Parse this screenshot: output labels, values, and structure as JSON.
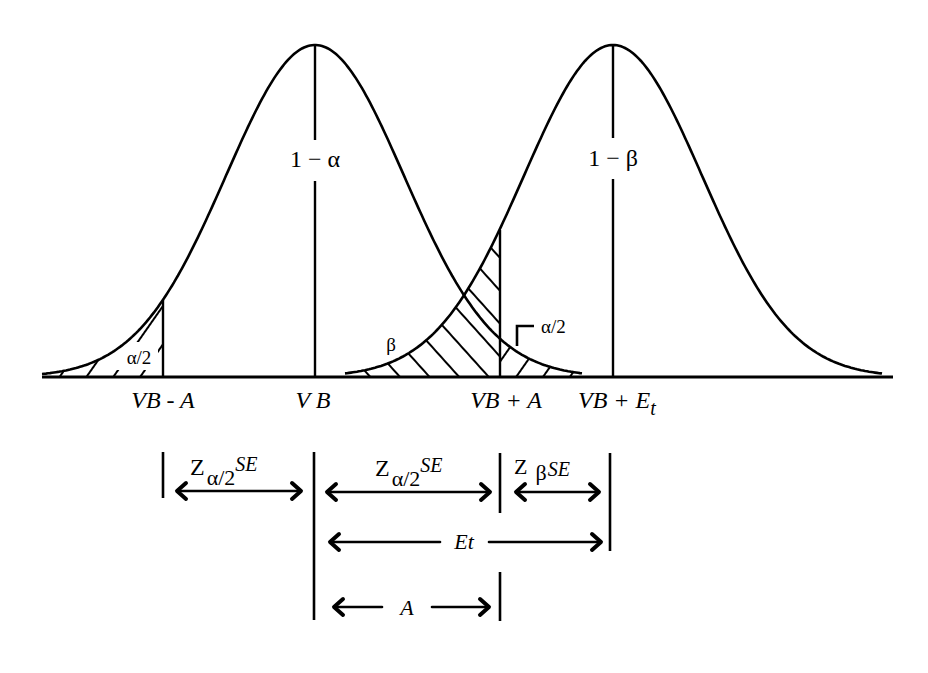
{
  "diagram": {
    "type": "two overlapping normal distributions (hypothesis test power diagram)",
    "colors": {
      "ink": "#000000",
      "background": "#ffffff"
    },
    "baseline": {
      "y": 377,
      "x_start": 42,
      "x_end": 893
    },
    "curves": [
      {
        "name": "null-distribution",
        "mean_x": 315,
        "sigma": 89,
        "peak_y": 45,
        "x_start": 42,
        "x_end": 582,
        "center_label": "1 − α"
      },
      {
        "name": "alternative-distribution",
        "mean_x": 613,
        "sigma": 89,
        "peak_y": 45,
        "x_start": 345,
        "x_end": 882,
        "center_label": "1 − β"
      }
    ],
    "markers": [
      {
        "name": "vb-minus-a",
        "x": 163,
        "label": "VB - A"
      },
      {
        "name": "vb",
        "x": 315,
        "label": "V B"
      },
      {
        "name": "vb-plus-a",
        "x": 500,
        "label": "VB + A"
      },
      {
        "name": "vb-plus-et",
        "x": 613,
        "label_main": "VB + E",
        "label_sub": "t"
      }
    ],
    "regions": {
      "left_tail_label": "α/2",
      "beta_label": "β",
      "right_tail_label": "α/2"
    },
    "dimensions": {
      "z_alpha_left": {
        "main": "Z",
        "sub": "α/2",
        "sup": "SE"
      },
      "z_alpha_right": {
        "main": "Z",
        "sub": "α/2",
        "sup": "SE"
      },
      "z_beta": {
        "main": "Z",
        "sub": "β",
        "sup": "SE"
      },
      "et": "Et",
      "a": "A"
    }
  }
}
